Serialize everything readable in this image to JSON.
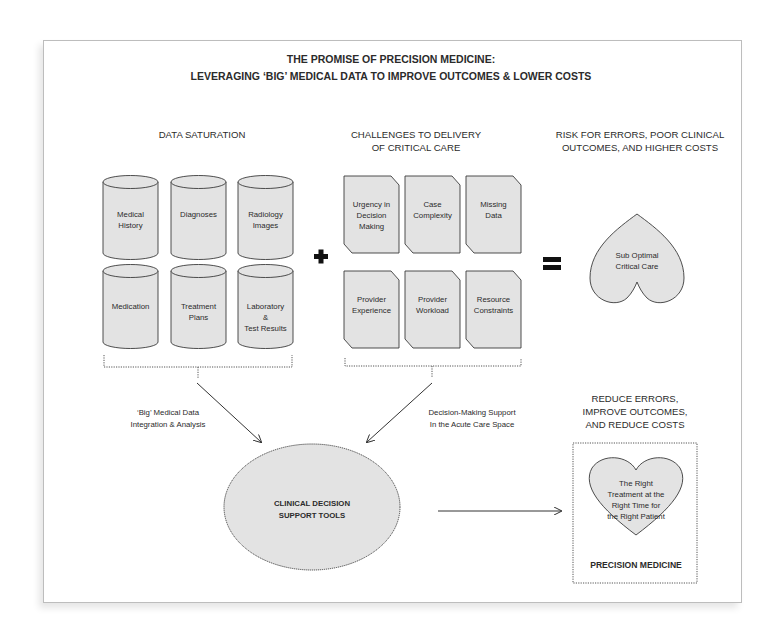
{
  "title": {
    "line1": "THE PROMISE OF PRECISION MEDICINE:",
    "line2": "LEVERAGING ‘BIG’ MEDICAL DATA TO IMPROVE OUTCOMES & LOWER COSTS"
  },
  "data_saturation": {
    "heading": "DATA SATURATION",
    "cylinders": [
      {
        "lines": [
          "Medical",
          "History"
        ]
      },
      {
        "lines": [
          "Diagnoses"
        ]
      },
      {
        "lines": [
          "Radiology",
          "Images"
        ]
      },
      {
        "lines": [
          "Medication"
        ]
      },
      {
        "lines": [
          "Treatment",
          "Plans"
        ]
      },
      {
        "lines": [
          "Laboratory",
          "&",
          "Test Results"
        ]
      }
    ]
  },
  "operators": {
    "plus": "+",
    "equals": "="
  },
  "challenges": {
    "heading_line1": "CHALLENGES TO DELIVERY",
    "heading_line2": "OF CRITICAL CARE",
    "documents": [
      {
        "lines": [
          "Urgency in",
          "Decision",
          "Making"
        ]
      },
      {
        "lines": [
          "Case",
          "Complexity"
        ]
      },
      {
        "lines": [
          "Missing",
          "Data"
        ]
      },
      {
        "lines": [
          "Provider",
          "Experience"
        ]
      },
      {
        "lines": [
          "Provider",
          "Workload"
        ]
      },
      {
        "lines": [
          "Resource",
          "Constraints"
        ]
      }
    ]
  },
  "risk": {
    "heading_line1": "RISK FOR ERRORS, POOR CLINICAL",
    "heading_line2": "OUTCOMES, AND HIGHER COSTS",
    "heart_lines": [
      "Sub Optimal",
      "Critical Care"
    ]
  },
  "flows": {
    "left_label_line1": "‘Big’ Medical Data",
    "left_label_line2": "Integration & Analysis",
    "right_label_line1": "Decision-Making Support",
    "right_label_line2": "In the Acute Care Space"
  },
  "cdst": {
    "line1": "CLINICAL DECISION",
    "line2": "SUPPORT TOOLS"
  },
  "outcome": {
    "heading_line1": "REDUCE ERRORS,",
    "heading_line2": "IMPROVE OUTCOMES,",
    "heading_line3": "AND REDUCE COSTS",
    "heart_lines": [
      "The Right",
      "Treatment at the",
      "Right Time for",
      "the Right Patient"
    ],
    "label": "PRECISION MEDICINE"
  },
  "colors": {
    "shape_fill": "#e3e3e3",
    "stroke": "#3a3a3a",
    "text": "#2b2b2b"
  }
}
